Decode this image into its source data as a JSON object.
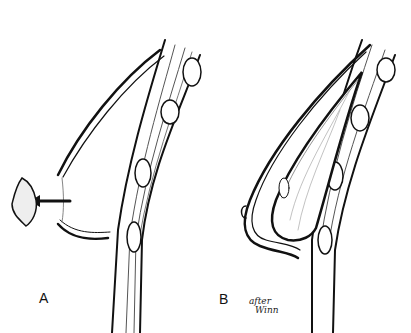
{
  "figure": {
    "panels": [
      {
        "label": "A",
        "description": "Lateral view, tissue removed (arrow pointing to excised tissue)"
      },
      {
        "label": "B",
        "description": "Lateral view with implant placed"
      }
    ],
    "signature_line1": "after",
    "signature_line2": "Winn",
    "colors": {
      "ink": "#111111",
      "background": "#ffffff"
    }
  }
}
